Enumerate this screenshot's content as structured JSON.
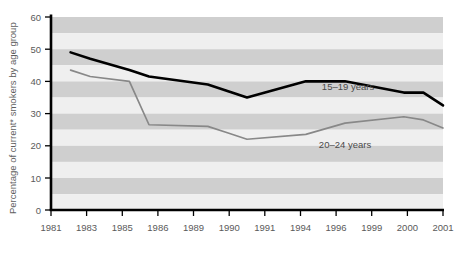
{
  "chart_data": {
    "type": "line",
    "title": "",
    "xlabel": "",
    "ylabel": "Percentage of current* smokers by age group",
    "ylim": [
      0,
      60
    ],
    "yticks": [
      0,
      10,
      20,
      30,
      40,
      50,
      60
    ],
    "ytick_labels": [
      "0",
      "10",
      "20",
      "30",
      "40",
      "50",
      "60"
    ],
    "categories": [
      "1981",
      "1983",
      "1985",
      "1986",
      "1989",
      "1990",
      "1991",
      "1994",
      "1996",
      "1999",
      "2000",
      "2001"
    ],
    "grid": "horizontal-banding",
    "legend_position": "inline-annotation",
    "series": [
      {
        "name": "15-19 years",
        "label": "15–19 years",
        "color": "#000000",
        "x": [
          "1982",
          "1983",
          "1985",
          "1986",
          "1989",
          "1990",
          "1991",
          "1994",
          "1996",
          "1999",
          "2000",
          "2001"
        ],
        "values": [
          49,
          47,
          43.5,
          41.5,
          39,
          37,
          35,
          40,
          40,
          36.5,
          36.5,
          32.5
        ]
      },
      {
        "name": "20-24 years",
        "label": "20–24 years",
        "color": "#888888",
        "x": [
          "1982",
          "1983",
          "1985",
          "1986",
          "1989",
          "1990",
          "1991",
          "1994",
          "1996",
          "1999",
          "2000",
          "2001"
        ],
        "values": [
          43.5,
          41.5,
          40,
          26.5,
          26,
          24,
          22,
          23.5,
          27,
          29,
          28,
          25.5
        ]
      }
    ],
    "annotations": [
      {
        "text": "15–19 years",
        "x": 1996,
        "y": 41.5
      },
      {
        "text": "20–24 years",
        "x": 1993,
        "y": 21
      }
    ],
    "colors": {
      "band_light": "#efefef",
      "band_dark": "#cfcfcf",
      "axis": "#000000",
      "series_15_19": "#000000",
      "series_20_24": "#8c8c8c",
      "background": "#ffffff"
    }
  },
  "axes": {
    "y_axis_title": "Percentage of current* smokers by age group",
    "y_ticks": [
      "60",
      "50",
      "40",
      "30",
      "20",
      "10",
      "0"
    ],
    "x_ticks": [
      "1981",
      "1983",
      "1985",
      "1986",
      "1989",
      "1990",
      "1991",
      "1994",
      "1996",
      "1999",
      "2000",
      "2001"
    ]
  },
  "series_labels": {
    "upper": "15–19 years",
    "lower": "20–24 years"
  }
}
